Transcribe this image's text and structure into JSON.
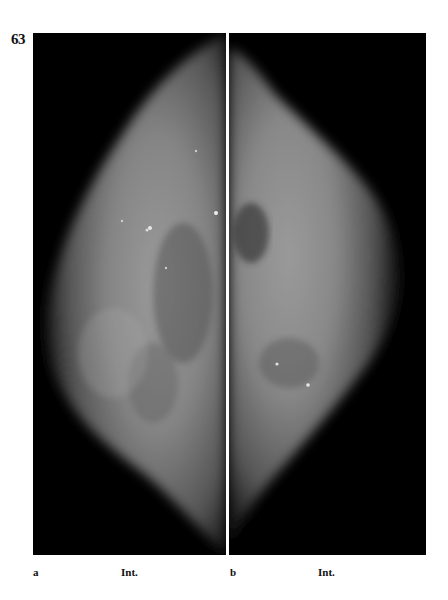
{
  "figure": {
    "number": "63",
    "panels": [
      {
        "letter": "a",
        "view": "Int."
      },
      {
        "letter": "b",
        "view": "Int."
      }
    ]
  },
  "colors": {
    "background": "#ffffff",
    "panel_background": "#000000",
    "tissue_light": "#9a9a9a",
    "tissue_mid": "#6e6e6e",
    "text": "#111111"
  }
}
